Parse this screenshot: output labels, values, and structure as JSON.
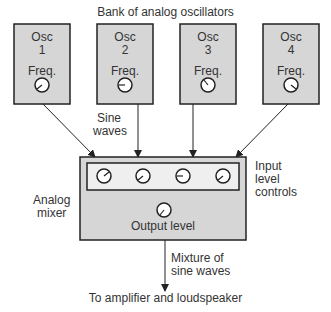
{
  "title": "Bank of analog oscillators",
  "oscillators": [
    {
      "name": "Osc",
      "number": "1",
      "control": "Freq."
    },
    {
      "name": "Osc",
      "number": "2",
      "control": "Freq."
    },
    {
      "name": "Osc",
      "number": "3",
      "control": "Freq."
    },
    {
      "name": "Osc",
      "number": "4",
      "control": "Freq."
    }
  ],
  "labels": {
    "sine_waves_1": "Sine",
    "sine_waves_2": "waves",
    "analog_mixer_1": "Analog",
    "analog_mixer_2": "mixer",
    "input_level_1": "Input",
    "input_level_2": "level",
    "input_level_3": "controls",
    "output_level": "Output level",
    "mixture_1": "Mixture of",
    "mixture_2": "sine waves",
    "destination": "To amplifier and loudspeaker"
  },
  "colors": {
    "box_fill": "#d6d6d6",
    "stroke": "#222222",
    "panel_fill": "#efefef"
  }
}
